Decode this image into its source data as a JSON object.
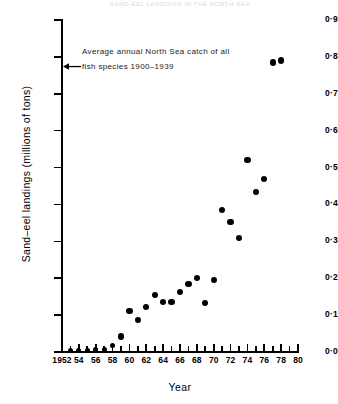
{
  "header": {
    "faint_title": "SAND-EEL LANDINGS IN THE NORTH SEA"
  },
  "annotation": {
    "line1": "Average annual North Sea catch of all",
    "line2": "fish species 1900–1939",
    "arrow_icon": "left-arrow-icon",
    "arrow_value": 0.775
  },
  "axes": {
    "y_title": "Sand–eel landings (millions of tons)",
    "x_title": "Year",
    "y_ticks": [
      "0·0",
      "0·1",
      "0·2",
      "0·3",
      "0·4",
      "0·5",
      "0·6",
      "0·7",
      "0·8",
      "0·9"
    ],
    "x_ticks": [
      "1952",
      "54",
      "56",
      "58",
      "60",
      "62",
      "64",
      "66",
      "68",
      "70",
      "72",
      "74",
      "76",
      "78",
      "80"
    ]
  },
  "colors": {
    "marker": "#000000",
    "axis": "#000000",
    "background": "#ffffff",
    "annotation_text": "#1a1a1a"
  },
  "chart_data": {
    "type": "scatter",
    "title": "SAND-EEL LANDINGS IN THE NORTH SEA",
    "xlabel": "Year",
    "ylabel": "Sand-eel landings (millions of tons)",
    "xlim": [
      1952,
      1980
    ],
    "ylim": [
      0.0,
      0.9
    ],
    "grid": false,
    "legend": null,
    "x_tick_step": 2,
    "x_minor_tick_step": 1,
    "y_tick_step": 0.1,
    "annotations": [
      {
        "text": "Average annual North Sea catch of all fish species 1900-1939",
        "y": 0.775,
        "marker": "left-arrow"
      }
    ],
    "x": [
      1953,
      1954,
      1955,
      1956,
      1957,
      1958,
      1959,
      1960,
      1961,
      1962,
      1963,
      1964,
      1965,
      1966,
      1967,
      1968,
      1969,
      1970,
      1971,
      1972,
      1973,
      1974,
      1975,
      1976,
      1977,
      1978
    ],
    "y": [
      0.004,
      0.004,
      0.005,
      0.006,
      0.008,
      0.018,
      0.042,
      0.112,
      0.086,
      0.122,
      0.155,
      0.135,
      0.136,
      0.163,
      0.185,
      0.2,
      0.132,
      0.196,
      0.385,
      0.352,
      0.308,
      0.521,
      0.434,
      0.47,
      0.785,
      0.79
    ],
    "series": [
      {
        "name": "Sand-eel landings",
        "marker": "filled-circle",
        "color": "#000000",
        "points": [
          {
            "x": 1953,
            "y": 0.004
          },
          {
            "x": 1954,
            "y": 0.004
          },
          {
            "x": 1955,
            "y": 0.005
          },
          {
            "x": 1956,
            "y": 0.006
          },
          {
            "x": 1957,
            "y": 0.008
          },
          {
            "x": 1958,
            "y": 0.018
          },
          {
            "x": 1959,
            "y": 0.042
          },
          {
            "x": 1960,
            "y": 0.112
          },
          {
            "x": 1961,
            "y": 0.086
          },
          {
            "x": 1962,
            "y": 0.122
          },
          {
            "x": 1963,
            "y": 0.155
          },
          {
            "x": 1964,
            "y": 0.135
          },
          {
            "x": 1965,
            "y": 0.136
          },
          {
            "x": 1966,
            "y": 0.163
          },
          {
            "x": 1967,
            "y": 0.185
          },
          {
            "x": 1968,
            "y": 0.2
          },
          {
            "x": 1969,
            "y": 0.132
          },
          {
            "x": 1970,
            "y": 0.196
          },
          {
            "x": 1971,
            "y": 0.385
          },
          {
            "x": 1972,
            "y": 0.352
          },
          {
            "x": 1973,
            "y": 0.308
          },
          {
            "x": 1974,
            "y": 0.521
          },
          {
            "x": 1975,
            "y": 0.434
          },
          {
            "x": 1976,
            "y": 0.47
          },
          {
            "x": 1977,
            "y": 0.785
          },
          {
            "x": 1978,
            "y": 0.79
          }
        ]
      }
    ]
  }
}
